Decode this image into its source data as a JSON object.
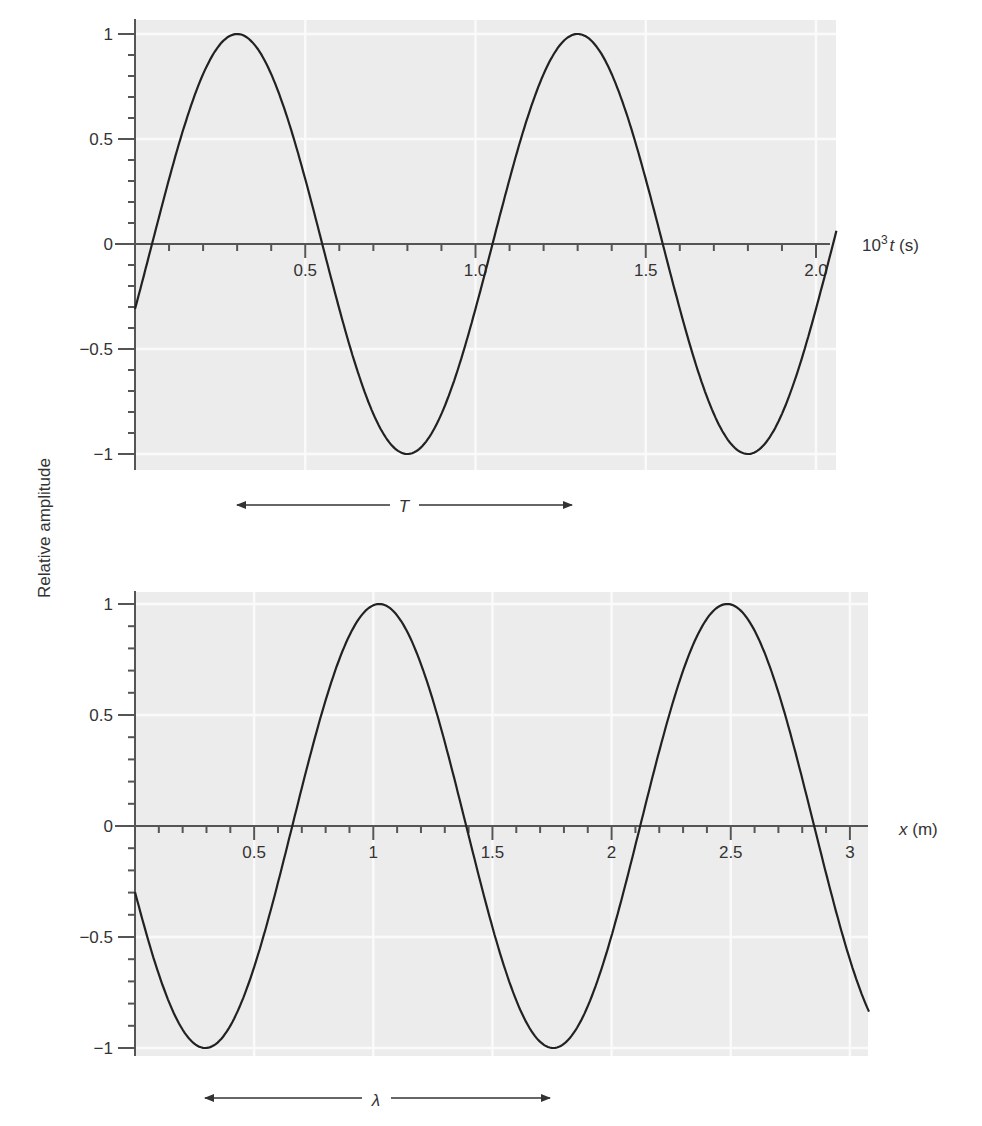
{
  "ylabel": "Relative amplitude",
  "colors": {
    "plot_background": "#ececec",
    "gridline": "#fafafa",
    "axis": "#555555",
    "curve": "#222222",
    "text": "#333333"
  },
  "chart_data": [
    {
      "type": "line",
      "title": "",
      "xlabel": "10^3 t (s)",
      "xlabel_parts": {
        "base": "10",
        "sup": "3",
        "var": "t",
        "unit": " (s)"
      },
      "ylabel": "Relative amplitude",
      "xlim": [
        0,
        2.06
      ],
      "ylim": [
        -1,
        1
      ],
      "grid": true,
      "x_ticks": [
        0.5,
        1.0,
        1.5,
        2.0
      ],
      "x_tick_labels": [
        "0.5",
        "1.0",
        "1.5",
        "2.0"
      ],
      "y_ticks": [
        1,
        0.5,
        0,
        -0.5,
        -1
      ],
      "y_tick_labels": [
        "1",
        "0.5",
        "0",
        "−0.5",
        "−1"
      ],
      "series": [
        {
          "name": "displacement vs time",
          "function": "sin(2*pi*(x - 0.05)/1.0)",
          "period": 1.0,
          "phase_zero": 0.05,
          "x": [
            0,
            0.05,
            0.3,
            0.55,
            0.8,
            1.05,
            1.3,
            1.55,
            1.8,
            2.05,
            2.06
          ],
          "values": [
            -0.31,
            0,
            1,
            0,
            -1,
            0,
            1,
            0,
            -1,
            0,
            0.06
          ]
        }
      ],
      "annotations": [
        {
          "label": "T",
          "type": "double-arrow",
          "x_from": 0.3,
          "x_to": 1.3
        }
      ]
    },
    {
      "type": "line",
      "title": "",
      "xlabel": "x (m)",
      "xlabel_parts": {
        "var": "x",
        "unit": " (m)"
      },
      "ylabel": "Relative amplitude",
      "xlim": [
        0,
        3.08
      ],
      "ylim": [
        -1,
        1
      ],
      "grid": true,
      "x_ticks": [
        0.5,
        1,
        1.5,
        2,
        2.5,
        3
      ],
      "x_tick_labels": [
        "0.5",
        "1",
        "1.5",
        "2",
        "2.5",
        "3"
      ],
      "y_ticks": [
        1,
        0.5,
        0,
        -0.5,
        -1
      ],
      "y_tick_labels": [
        "1",
        "0.5",
        "0",
        "−0.5",
        "−1"
      ],
      "series": [
        {
          "name": "displacement vs position",
          "function": "sin(2*pi*(x - 0.66)/1.46)",
          "period": 1.46,
          "phase_zero": 0.66,
          "x": [
            0,
            0.295,
            0.66,
            1.025,
            1.39,
            1.755,
            2.12,
            2.485,
            2.85,
            3.08
          ],
          "values": [
            -0.3,
            -1,
            0,
            1,
            0,
            -1,
            0,
            1,
            0,
            -0.84
          ]
        }
      ],
      "annotations": [
        {
          "label": "λ",
          "type": "double-arrow",
          "x_from": 0.295,
          "x_to": 1.755
        }
      ]
    }
  ]
}
